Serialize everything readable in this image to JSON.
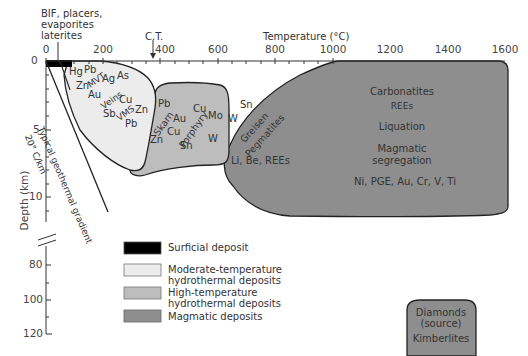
{
  "header": {
    "surface_note": [
      "BIF, placers,",
      "evaporites",
      "laterites"
    ],
    "ct_label": "C.T.",
    "x_axis_title": "Temperature (°C)"
  },
  "axes": {
    "x_ticks": [
      "0",
      "200",
      "400",
      "600",
      "800",
      "1000",
      "1200",
      "1600",
      "1400"
    ],
    "x_tick_values": [
      0,
      200,
      400,
      600,
      800,
      1000,
      1200,
      1400,
      1600
    ],
    "y_axis_title": "Depth (km)",
    "y_ticks_upper": [
      "0",
      "5",
      "10"
    ],
    "y_ticks_lower": [
      "80",
      "100",
      "120"
    ]
  },
  "geotherm": {
    "label_line1": "Typical geothermal gradient",
    "label_line2": "20° C/km"
  },
  "regions": {
    "moderate": {
      "labels": [
        "Hg",
        "Pb",
        "Zn",
        "MVT",
        "Ag",
        "As",
        "Au",
        "Veins",
        "Cu",
        "Sb",
        "VMS",
        "Zn",
        "Pb"
      ]
    },
    "high": {
      "labels": [
        "Pb",
        "Skarn",
        "Au",
        "Cu",
        "Zn",
        "Porphyry",
        "Sn",
        "Cu",
        "Mo",
        "W"
      ]
    },
    "magmatic": {
      "labels": [
        "Sn",
        "W",
        "Greisen",
        "Pegmatites",
        "Li, Be, REEs",
        "Carbonatites",
        "REEs",
        "Liquation",
        "Magmatic",
        "segregation",
        "Ni, PGE, Au, Cr, V, Ti"
      ]
    },
    "kimberlite": {
      "labels": [
        "Diamonds",
        "(source)",
        "Kimberlites"
      ]
    }
  },
  "legend": [
    {
      "label": [
        "Surficial deposit"
      ],
      "color": "#000000"
    },
    {
      "label": [
        "Moderate-temperature",
        "hydrothermal deposits"
      ],
      "color": "#ececec"
    },
    {
      "label": [
        "High-temperature",
        "hydrothermal deposits"
      ],
      "color": "#bdbdbd"
    },
    {
      "label": [
        "Magmatic deposits"
      ],
      "color": "#8e8e8e"
    }
  ],
  "colors": {
    "surficial": "#000000",
    "moderate": "#ececec",
    "high": "#bdbdbd",
    "magmatic": "#8e8e8e",
    "outline": "#222222"
  }
}
